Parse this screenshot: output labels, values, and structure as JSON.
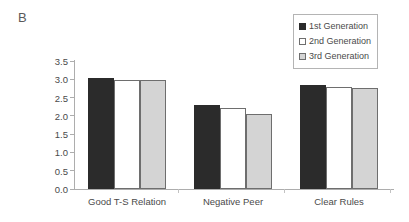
{
  "panel": {
    "label": "B"
  },
  "legend": {
    "position": "top-right",
    "items": [
      {
        "label": "1st Generation",
        "color": "#2b2b2b",
        "border": "#2b2b2b"
      },
      {
        "label": "2nd Generation",
        "color": "#ffffff",
        "border": "#6e6e6e"
      },
      {
        "label": "3rd Generation",
        "color": "#d4d4d4",
        "border": "#6e6e6e"
      }
    ]
  },
  "axis": {
    "y_ticks": [
      "3.5",
      "3.0",
      "2.5",
      "2.0",
      "1.5",
      "1.0",
      "0.5",
      "0.0"
    ]
  },
  "chart_data": {
    "type": "bar",
    "title": "B",
    "xlabel": "",
    "ylabel": "",
    "ylim": [
      0.0,
      3.5
    ],
    "ytick_step": 0.5,
    "grid": false,
    "legend_position": "top-right",
    "categories": [
      "Good T-S Relation",
      "Negative Peer",
      "Clear Rules"
    ],
    "series": [
      {
        "name": "1st Generation",
        "color": "#2b2b2b",
        "values": [
          3.03,
          2.3,
          2.84
        ]
      },
      {
        "name": "2nd Generation",
        "color": "#ffffff",
        "values": [
          2.98,
          2.21,
          2.79
        ]
      },
      {
        "name": "3rd Generation",
        "color": "#d4d4d4",
        "values": [
          2.98,
          2.05,
          2.76
        ]
      }
    ]
  }
}
